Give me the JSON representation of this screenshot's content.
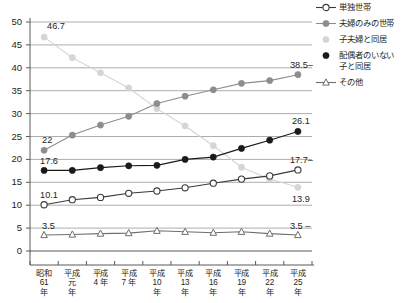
{
  "chart_data": {
    "type": "line",
    "title": "",
    "xlabel": "",
    "ylabel": "",
    "ylim": [
      0,
      50
    ],
    "ytick_step": 5,
    "grid": true,
    "legend_position": "right",
    "categories": [
      "昭和\n61\n年",
      "平成\n元\n年",
      "平成\n4\n年",
      "平成\n7\n年",
      "平成\n10\n年",
      "平成\n13\n年",
      "平成\n16\n年",
      "平成\n19\n年",
      "平成\n22\n年",
      "平成\n25\n年"
    ],
    "yticks": [
      "0",
      "5",
      "10",
      "15",
      "20",
      "25",
      "30",
      "35",
      "40",
      "45",
      "50"
    ],
    "series": [
      {
        "name": "単独世帯",
        "color": "#3a3a3a",
        "marker": "open-circle",
        "values": [
          10.1,
          11.2,
          11.7,
          12.6,
          13.1,
          13.8,
          14.8,
          15.7,
          16.4,
          17.7
        ],
        "start_label": "10.1",
        "end_label": "17.7"
      },
      {
        "name": "夫婦のみの世帯",
        "color": "#8d8d8d",
        "marker": "filled-circle",
        "values": [
          22.0,
          25.3,
          27.5,
          29.4,
          32.2,
          33.8,
          35.2,
          36.6,
          37.2,
          38.5
        ],
        "start_label": "22",
        "end_label": "38.5"
      },
      {
        "name": "子夫婦と同居",
        "color": "#d5d5d5",
        "marker": "filled-circle",
        "values": [
          46.7,
          42.2,
          38.9,
          35.6,
          31.1,
          27.3,
          23.0,
          18.3,
          15.7,
          13.9
        ],
        "start_label": "46.7",
        "end_label": "13.9"
      },
      {
        "name": "配偶者のいない\n子と同居",
        "color": "#1a1a1a",
        "marker": "filled-circle",
        "values": [
          17.6,
          17.6,
          18.2,
          18.6,
          18.7,
          20.0,
          20.5,
          22.4,
          24.2,
          26.1
        ],
        "start_label": "17.6",
        "end_label": "26.1"
      },
      {
        "name": "その他",
        "color": "#6e6e6e",
        "marker": "open-triangle",
        "values": [
          3.5,
          3.6,
          3.8,
          3.9,
          4.4,
          4.2,
          4.0,
          4.2,
          3.8,
          3.5
        ],
        "start_label": "3.5",
        "end_label": "3.5"
      }
    ]
  },
  "legend": {
    "items": [
      {
        "label": "単独世帯"
      },
      {
        "label": "夫婦のみの世帯"
      },
      {
        "label": "子夫婦と同居"
      },
      {
        "label": "配偶者のいない\n子と同居"
      },
      {
        "label": "その他"
      }
    ]
  },
  "colors": {
    "axis": "#5a5a5a",
    "grid": "#8a8a8a",
    "text": "#231f20",
    "background": "#ffffff"
  }
}
